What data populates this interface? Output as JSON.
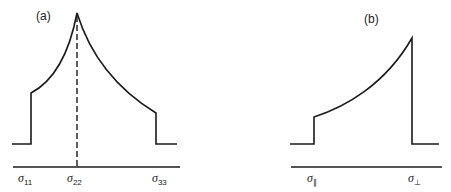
{
  "figure": {
    "panels": [
      {
        "label": "(a)",
        "axis_labels": [
          {
            "symbol": "σ",
            "sub": "11"
          },
          {
            "symbol": "σ",
            "sub": "22"
          },
          {
            "symbol": "σ",
            "sub": "33"
          }
        ],
        "description": "Powder lineshape with steps at σ11 and σ33 and a cusp (peak) at σ22; dashed line marks σ22"
      },
      {
        "label": "(b)",
        "axis_labels": [
          {
            "symbol": "σ",
            "sub": "∥"
          },
          {
            "symbol": "σ",
            "sub": "⊥"
          }
        ],
        "description": "Axially symmetric powder lineshape rising from a step at σ∥ to a maximum at σ⊥ then dropping sharply"
      }
    ]
  }
}
